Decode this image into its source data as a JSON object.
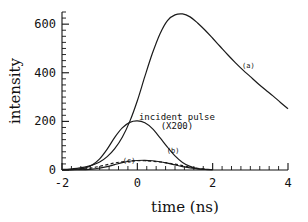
{
  "chart_data": {
    "type": "line",
    "title": "",
    "xlabel": "time (ns)",
    "ylabel": "intensity",
    "xlim": [
      -2,
      4
    ],
    "ylim": [
      0,
      650
    ],
    "xticks": [
      -2,
      0,
      2,
      4
    ],
    "xticklabels": [
      "-2",
      "0",
      "2",
      "4"
    ],
    "yticks": [
      0,
      200,
      400,
      600
    ],
    "yticklabels": [
      "0",
      "200",
      "400",
      "600"
    ],
    "x_minor_tick_step": 0.25,
    "y_minor_tick_step": 25,
    "grid": false,
    "legend": "inline-annotations",
    "annotations": [
      {
        "label": "(a)",
        "x": 2.95,
        "y": 420
      },
      {
        "label": "incident pulse",
        "x": 1.05,
        "y": 205
      },
      {
        "label": "(X200)",
        "x": 1.05,
        "y": 170
      },
      {
        "label": "(b)",
        "x": 0.95,
        "y": 70
      },
      {
        "label": "(c)",
        "x": -0.22,
        "y": 28
      }
    ],
    "series": [
      {
        "name": "(a)",
        "style": "solid",
        "x": [
          -2.0,
          -1.8,
          -1.6,
          -1.4,
          -1.2,
          -1.0,
          -0.8,
          -0.6,
          -0.4,
          -0.2,
          0.0,
          0.2,
          0.4,
          0.6,
          0.8,
          1.0,
          1.2,
          1.4,
          1.6,
          1.8,
          2.0,
          2.2,
          2.4,
          2.6,
          2.8,
          3.0,
          3.2,
          3.4,
          3.6,
          3.8,
          4.0
        ],
        "y": [
          2,
          4,
          7,
          12,
          20,
          33,
          55,
          88,
          135,
          200,
          285,
          385,
          480,
          560,
          615,
          638,
          642,
          630,
          605,
          575,
          542,
          508,
          474,
          442,
          412,
          384,
          356,
          330,
          305,
          278,
          252
        ]
      },
      {
        "name": "incident pulse (X200)",
        "style": "solid",
        "x": [
          -2.0,
          -1.8,
          -1.6,
          -1.4,
          -1.2,
          -1.0,
          -0.8,
          -0.6,
          -0.4,
          -0.2,
          0.0,
          0.2,
          0.4,
          0.6,
          0.8,
          1.0,
          1.2,
          1.4,
          1.6,
          1.8,
          2.0
        ],
        "y": [
          0,
          1,
          3,
          8,
          21,
          46,
          86,
          134,
          173,
          196,
          202,
          194,
          170,
          133,
          94,
          58,
          31,
          15,
          6,
          2,
          1
        ]
      },
      {
        "name": "(b)",
        "style": "solid",
        "x": [
          -2.0,
          -1.6,
          -1.2,
          -1.0,
          -0.8,
          -0.6,
          -0.4,
          -0.2,
          0.0,
          0.2,
          0.4,
          0.6,
          0.8,
          1.0,
          1.2,
          1.4,
          1.6,
          1.8,
          2.0
        ],
        "y": [
          0,
          1,
          4,
          8,
          14,
          22,
          30,
          36,
          39,
          40,
          38,
          34,
          28,
          21,
          14,
          9,
          5,
          3,
          1
        ]
      },
      {
        "name": "(c)",
        "style": "dashed",
        "x": [
          -1.7,
          -1.4,
          -1.2,
          -1.0,
          -0.8,
          -0.6,
          -0.4,
          -0.2,
          0.0,
          0.2,
          0.4,
          0.6,
          0.8,
          1.0,
          1.2,
          1.4,
          1.6,
          1.8
        ],
        "y": [
          2,
          5,
          9,
          15,
          22,
          29,
          34,
          37,
          38,
          38,
          36,
          33,
          29,
          24,
          18,
          12,
          7,
          3
        ]
      }
    ],
    "colors": {
      "ink": "#111111",
      "background": "#ffffff"
    }
  }
}
